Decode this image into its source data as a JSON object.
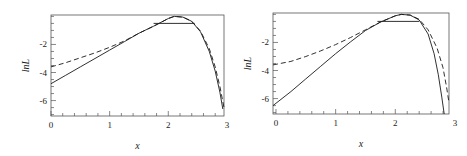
{
  "chart_data": [
    {
      "type": "line",
      "title": "",
      "xlabel": "x",
      "ylabel": "ln L",
      "xlim": [
        0,
        2.95
      ],
      "ylim": [
        -7.1,
        0.1
      ],
      "xticks": [
        0,
        1,
        2,
        3
      ],
      "yticks": [
        -2,
        -4,
        -6
      ],
      "grid": false,
      "legend": null,
      "series": [
        {
          "name": "solid",
          "style": "solid",
          "x": [
            0,
            0.25,
            0.5,
            0.75,
            1.0,
            1.25,
            1.5,
            1.75,
            2.0,
            2.1,
            2.25,
            2.4,
            2.55,
            2.7,
            2.8,
            2.88,
            2.93
          ],
          "y": [
            -4.8,
            -4.2,
            -3.6,
            -3.0,
            -2.4,
            -1.8,
            -1.2,
            -0.7,
            -0.15,
            0.0,
            -0.05,
            -0.35,
            -1.1,
            -2.5,
            -3.9,
            -5.4,
            -6.6
          ]
        },
        {
          "name": "dashed",
          "style": "dashed",
          "x": [
            0,
            0.25,
            0.5,
            0.75,
            1.0,
            1.25,
            1.5,
            1.75,
            2.0,
            2.1,
            2.25,
            2.4,
            2.55,
            2.7,
            2.8,
            2.88,
            2.95
          ],
          "y": [
            -3.6,
            -3.3,
            -2.95,
            -2.6,
            -2.2,
            -1.75,
            -1.2,
            -0.7,
            -0.15,
            0.0,
            -0.05,
            -0.35,
            -1.05,
            -2.3,
            -3.6,
            -5.0,
            -6.5
          ]
        },
        {
          "name": "horizontal",
          "style": "solid",
          "x": [
            1.75,
            2.45
          ],
          "y": [
            -0.5,
            -0.5
          ]
        }
      ]
    },
    {
      "type": "line",
      "title": "",
      "xlabel": "x",
      "ylabel": "ln L",
      "xlim": [
        -0.05,
        2.9
      ],
      "ylim": [
        -7.1,
        0.1
      ],
      "xticks": [
        0,
        1,
        2,
        3
      ],
      "yticks": [
        -2,
        -4,
        -6
      ],
      "grid": false,
      "legend": null,
      "series": [
        {
          "name": "solid",
          "style": "solid",
          "x": [
            -0.05,
            0.25,
            0.5,
            0.75,
            1.0,
            1.25,
            1.5,
            1.75,
            2.0,
            2.1,
            2.25,
            2.4,
            2.55,
            2.65,
            2.72,
            2.78,
            2.82
          ],
          "y": [
            -6.5,
            -5.5,
            -4.6,
            -3.7,
            -2.8,
            -1.95,
            -1.15,
            -0.55,
            -0.1,
            0.0,
            -0.05,
            -0.4,
            -1.4,
            -2.8,
            -4.3,
            -5.9,
            -7.1
          ]
        },
        {
          "name": "dashed",
          "style": "dashed",
          "x": [
            -0.05,
            0.25,
            0.5,
            0.75,
            1.0,
            1.25,
            1.5,
            1.75,
            2.0,
            2.1,
            2.25,
            2.4,
            2.55,
            2.7,
            2.8,
            2.86,
            2.9
          ],
          "y": [
            -3.6,
            -3.35,
            -3.0,
            -2.6,
            -2.15,
            -1.65,
            -1.1,
            -0.55,
            -0.1,
            0.0,
            -0.05,
            -0.35,
            -1.1,
            -2.4,
            -3.8,
            -5.2,
            -6.3
          ]
        },
        {
          "name": "horizontal",
          "style": "solid",
          "x": [
            1.7,
            2.4
          ],
          "y": [
            -0.5,
            -0.5
          ]
        }
      ]
    }
  ],
  "panels": [
    {
      "box": {
        "left": 51,
        "top": 15,
        "right": 224,
        "bottom": 116
      },
      "tick_labels_x": [
        "0",
        "1",
        "2",
        "3"
      ],
      "tick_labels_y": [
        "-2",
        "-4",
        "-6"
      ],
      "xlabel": "x",
      "ylabel": "lnL"
    },
    {
      "box": {
        "left": 273,
        "top": 13,
        "right": 449,
        "bottom": 114
      },
      "tick_labels_x": [
        "0",
        "1",
        "2",
        "3"
      ],
      "tick_labels_y": [
        "-2",
        "-4",
        "-6"
      ],
      "xlabel": "x",
      "ylabel": "lnL"
    }
  ],
  "colors": {
    "line": "#1a1a1a",
    "frame": "#555555"
  }
}
